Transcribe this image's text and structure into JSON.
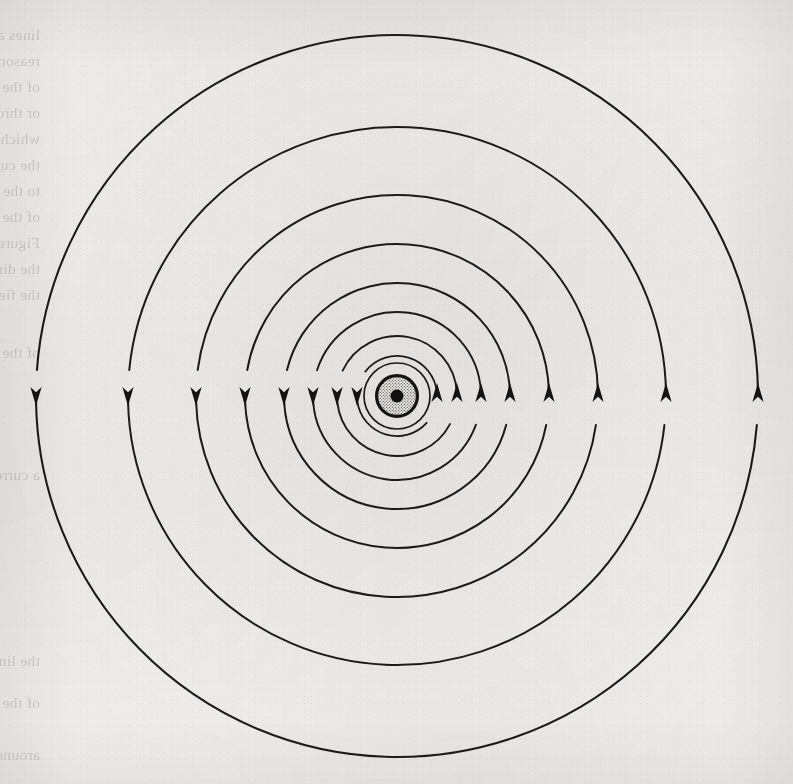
{
  "page": {
    "kind": "scanned-book-figure",
    "width": 793,
    "height": 784,
    "paper_color": "#f2f1ee",
    "ink_color": "#1c1b1a",
    "ghost_text_color": "#9d9a95",
    "caption": ""
  },
  "figure": {
    "name": "magnetic-field-lines-around-current-carrying-conductor",
    "center": {
      "x": 397,
      "y": 396
    },
    "conductor": {
      "name": "conductor-cross-section",
      "outline_radius": 22,
      "outline_width": 3.2,
      "fill_pattern": "stipple",
      "fill_color": "#cfcdc8",
      "core_dot_radius": 6.5,
      "core_dot_color": "#100f0e"
    },
    "arrow": {
      "left_direction": "down",
      "right_direction": "up",
      "circulation": "counterclockwise-on-page",
      "head_length": 19,
      "head_half_width": 5.6,
      "left_tip_y": 406,
      "right_tip_y": 383
    },
    "field_lines": [
      {
        "id": 1,
        "radius": 33,
        "stroke_width": 1.7,
        "has_left_arrow": false,
        "has_right_arrow": false
      },
      {
        "id": 2,
        "radius": 40,
        "stroke_width": 1.8,
        "has_left_arrow": true,
        "has_right_arrow": true
      },
      {
        "id": 3,
        "radius": 60,
        "stroke_width": 1.9,
        "has_left_arrow": true,
        "has_right_arrow": true
      },
      {
        "id": 4,
        "radius": 84,
        "stroke_width": 1.9,
        "has_left_arrow": true,
        "has_right_arrow": true
      },
      {
        "id": 5,
        "radius": 113,
        "stroke_width": 2.0,
        "has_left_arrow": true,
        "has_right_arrow": true
      },
      {
        "id": 6,
        "radius": 152,
        "stroke_width": 2.0,
        "has_left_arrow": true,
        "has_right_arrow": true
      },
      {
        "id": 7,
        "radius": 201,
        "stroke_width": 2.0,
        "has_left_arrow": true,
        "has_right_arrow": true
      },
      {
        "id": 8,
        "radius": 269,
        "stroke_width": 2.0,
        "has_left_arrow": true,
        "has_right_arrow": true
      },
      {
        "id": 9,
        "radius": 361,
        "stroke_width": 2.1,
        "has_left_arrow": true,
        "has_right_arrow": true
      }
    ]
  },
  "ghost_text": {
    "note": "Faint mirrored show-through text from the reverse page; illegible in the scan.",
    "lines": [
      {
        "x": 40,
        "y": 22,
        "text": "lines and there is a field to be"
      },
      {
        "x": 40,
        "y": 48,
        "text": "reason the magnetic lines of force"
      },
      {
        "x": 40,
        "y": 74,
        "text": "of the magnet, and in all directions"
      },
      {
        "x": 40,
        "y": 100,
        "text": "or through, the iron core"
      },
      {
        "x": 40,
        "y": 126,
        "text": "which is at rest in the field of"
      },
      {
        "x": 40,
        "y": 152,
        "text": "the current in the direction of"
      },
      {
        "x": 40,
        "y": 178,
        "text": "to the lines of force of a magnetic"
      },
      {
        "x": 40,
        "y": 204,
        "text": "of the conductor as shown in"
      },
      {
        "x": 40,
        "y": 230,
        "text": "Figure 7-4 the direction of the"
      },
      {
        "x": 40,
        "y": 256,
        "text": "the direction of the current in"
      },
      {
        "x": 40,
        "y": 282,
        "text": "the field. The intensity of the"
      },
      {
        "x": 40,
        "y": 340,
        "text": "of the conductor carrying"
      },
      {
        "x": 40,
        "y": 462,
        "text": "a current in a circular"
      },
      {
        "x": 40,
        "y": 648,
        "text": "the lines and the"
      },
      {
        "x": 40,
        "y": 690,
        "text": "of the magnetic field"
      },
      {
        "x": 40,
        "y": 742,
        "text": "around a straight wire"
      }
    ]
  }
}
